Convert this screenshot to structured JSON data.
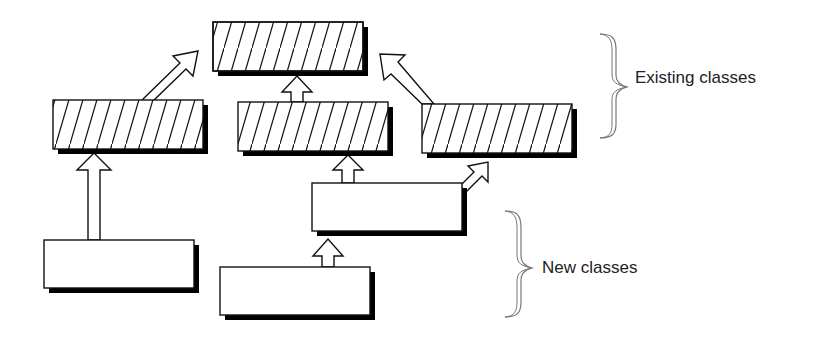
{
  "diagram": {
    "title": "",
    "groups": [
      {
        "id": "existing",
        "label": "Existing classes"
      },
      {
        "id": "new",
        "label": "New classes"
      }
    ],
    "nodes": [
      {
        "id": "base",
        "group": "existing",
        "style": "hatched"
      },
      {
        "id": "existing-left",
        "group": "existing",
        "style": "hatched"
      },
      {
        "id": "existing-center",
        "group": "existing",
        "style": "hatched"
      },
      {
        "id": "existing-right",
        "group": "existing",
        "style": "hatched"
      },
      {
        "id": "new-mid",
        "group": "new",
        "style": "plain"
      },
      {
        "id": "new-left",
        "group": "new",
        "style": "plain"
      },
      {
        "id": "new-bottom",
        "group": "new",
        "style": "plain"
      }
    ],
    "edges": [
      {
        "from": "existing-left",
        "to": "base",
        "type": "inherits"
      },
      {
        "from": "existing-center",
        "to": "base",
        "type": "inherits"
      },
      {
        "from": "existing-right",
        "to": "base",
        "type": "inherits"
      },
      {
        "from": "new-left",
        "to": "existing-left",
        "type": "inherits"
      },
      {
        "from": "new-mid",
        "to": "existing-center",
        "type": "inherits"
      },
      {
        "from": "new-mid",
        "to": "existing-right",
        "type": "inherits"
      },
      {
        "from": "new-bottom",
        "to": "new-mid",
        "type": "inherits"
      }
    ],
    "colors": {
      "stroke": "#111111",
      "shadow": "#000000",
      "fill": "#ffffff",
      "brace": "#777777",
      "text": "#222222"
    }
  }
}
